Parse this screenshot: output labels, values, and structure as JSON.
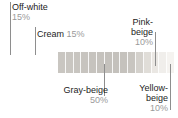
{
  "chart_data": {
    "type": "bar",
    "title": "",
    "subtitle": "",
    "xlabel": "",
    "ylabel": "",
    "orientation": "horizontal-stacked-strip",
    "legend_position": "callouts",
    "grid": false,
    "categories": [
      "Off-white",
      "Cream",
      "Gray-beige",
      "Pink-beige",
      "Yellow-beige"
    ],
    "values": [
      15,
      15,
      50,
      10,
      10
    ],
    "value_labels": [
      "15%",
      "15%",
      "50%",
      "10%",
      "10%"
    ],
    "units": "percent",
    "total": 100,
    "segment_count": 15,
    "swatch_colors": [
      "#c9c6c1",
      "#c9c6c1",
      "#c7c4bf",
      "#c6c3be",
      "#c5c2bd",
      "#c4c1bc",
      "#c3c0bb",
      "#c3c0bb",
      "#c4c1bc",
      "#c6c3be",
      "#d2cfca",
      "#dedbd6",
      "#e8e5e1",
      "#efedea",
      "#f4f2ef"
    ],
    "gradient_start": "#c9c6c1",
    "gradient_end": "#f4f2ef"
  },
  "strip": {
    "segments": [
      {
        "color": "#c9c6c1"
      },
      {
        "color": "#c9c6c1"
      },
      {
        "color": "#c8c5c0"
      },
      {
        "color": "#c7c4bf"
      },
      {
        "color": "#c6c3be"
      },
      {
        "color": "#c5c2bd"
      },
      {
        "color": "#c4c1bc"
      },
      {
        "color": "#c4c1bc"
      },
      {
        "color": "#c5c2bd"
      },
      {
        "color": "#c8c5c0"
      },
      {
        "color": "#d4d1cc"
      },
      {
        "color": "#e0ddd8"
      },
      {
        "color": "#eae7e3"
      },
      {
        "color": "#f0eeeb"
      },
      {
        "color": "#f5f3f0"
      }
    ]
  },
  "callouts": {
    "off_white": {
      "name": "Off-white",
      "pct": "15%"
    },
    "cream": {
      "name": "Cream",
      "pct": "15%"
    },
    "pink_beige": {
      "name": "Pink-\nbeige",
      "pct": "10%"
    },
    "gray_beige": {
      "name": "Gray-beige",
      "pct": "50%"
    },
    "yellow_beige": {
      "name": "Yellow-\nbeige",
      "pct": "10%"
    }
  },
  "colors": {
    "label_text": "#1c1c1c",
    "percent_text": "#9a9a9a",
    "leader_line": "#8e8e8e",
    "background": "#ffffff"
  }
}
